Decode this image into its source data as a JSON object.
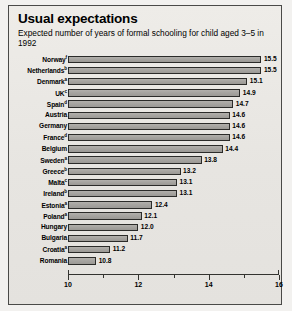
{
  "panel": {
    "title": "Usual expectations",
    "subtitle": "Expected number of years of formal schooling for child aged 3–5 in 1992"
  },
  "chart_data": {
    "type": "bar",
    "orientation": "horizontal",
    "title": "Usual expectations",
    "subtitle": "Expected number of years of formal schooling for child aged 3–5 in 1992",
    "xlabel": "",
    "ylabel": "",
    "xlim": [
      10,
      16
    ],
    "grid": false,
    "legend": null,
    "xticks": [
      10,
      11,
      12,
      13,
      14,
      15,
      16
    ],
    "xtick_labels": [
      "10",
      "",
      "12",
      "",
      "14",
      "",
      "16"
    ],
    "categories": [
      "Norway",
      "Netherlands",
      "Denmark",
      "UK",
      "Spain",
      "Austria",
      "Germany",
      "France",
      "Belgium",
      "Sweden",
      "Greece",
      "Malta",
      "Ireland",
      "Estonia",
      "Poland",
      "Hungary",
      "Bulgaria",
      "Croatia",
      "Romania"
    ],
    "footnotes": [
      "f",
      "b",
      "a",
      "c",
      "d",
      "",
      "",
      "d",
      "",
      "a",
      "b",
      "c",
      "b",
      "a",
      "a",
      "",
      "",
      "a",
      ""
    ],
    "values": [
      15.5,
      15.5,
      15.1,
      14.9,
      14.7,
      14.6,
      14.6,
      14.6,
      14.4,
      13.8,
      13.2,
      13.1,
      13.1,
      12.4,
      12.1,
      12.0,
      11.7,
      11.2,
      10.8
    ],
    "value_labels": [
      "15.5",
      "15.5",
      "15.1",
      "14.9",
      "14.7",
      "14.6",
      "14.6",
      "14.6",
      "14.4",
      "13.8",
      "13.2",
      "13.1",
      "13.1",
      "12.4",
      "12.1",
      "12.0",
      "11.7",
      "11.2",
      "10.8"
    ],
    "colors": {
      "bar_fill": "#a6a4a0",
      "bar_outline": "#2b2b29",
      "panel_background": "#e9e7e3",
      "axis": "#33332f",
      "text": "#000000"
    }
  }
}
